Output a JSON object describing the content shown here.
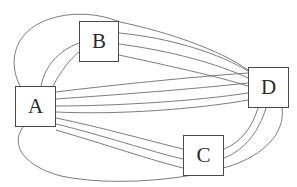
{
  "diagram": {
    "type": "multigraph",
    "title": "",
    "background_color": "#ffffff",
    "node_border_color": "#4a4a4a",
    "node_fill_color": "#ffffff",
    "edge_color": "#6e6e6e",
    "nodes": [
      {
        "id": "A",
        "label": "A",
        "x": 15,
        "y": 86,
        "width": 41,
        "height": 41
      },
      {
        "id": "B",
        "label": "B",
        "x": 79,
        "y": 21,
        "width": 40,
        "height": 41
      },
      {
        "id": "C",
        "label": "C",
        "x": 183,
        "y": 135,
        "width": 41,
        "height": 41
      },
      {
        "id": "D",
        "label": "D",
        "x": 248,
        "y": 67,
        "width": 41,
        "height": 41
      }
    ],
    "edges": [
      {
        "source": "A",
        "target": "B",
        "count": 2
      },
      {
        "source": "A",
        "target": "D",
        "count": 4
      },
      {
        "source": "A",
        "target": "C",
        "count": 3
      },
      {
        "source": "B",
        "target": "D",
        "count": 3
      },
      {
        "source": "C",
        "target": "D",
        "count": 2
      },
      {
        "source": "A",
        "target": "D",
        "count": 1,
        "note": "outer ellipse arc over top"
      },
      {
        "source": "A",
        "target": "D",
        "count": 1,
        "note": "outer ellipse arc under bottom"
      }
    ],
    "edge_paths": [
      "M 20 86 C 8 62 14 36 40 23 C 64 11 96 12 120 22",
      "M 120 42 C 168 46 216 56 248 72",
      "M 41 86 C 45 66 58 52 79 44",
      "M 52 88 C 62 70 70 58 79 50",
      "M 119 33 C 170 38 218 52 248 70",
      "M 119 44 C 170 50 216 62 248 76",
      "M 119 55 C 168 64 214 72 248 82",
      "M 56 92 C 110 86 190 78 248 74",
      "M 56 99 C 112 96 192 90 248 84",
      "M 56 106 C 114 106 194 100 248 92",
      "M 56 112 C 116 114 196 108 248 99",
      "M 56 118 C 100 126 150 140 183 148",
      "M 56 124 C 102 134 152 150 183 158",
      "M 56 130 C 104 142 154 160 183 167",
      "M 224 150 C 240 144 252 128 258 108",
      "M 224 158 C 244 150 258 132 265 108",
      "M 23 127 C 10 146 26 166 60 175 C 110 186 190 180 235 164 C 268 152 284 130 282 108"
    ]
  }
}
